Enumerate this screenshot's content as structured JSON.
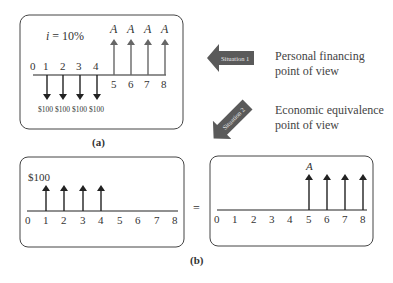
{
  "panel_a": {
    "interest_label": "i = 10%",
    "ticks": [
      "0",
      "1",
      "2",
      "3",
      "4",
      "5",
      "6",
      "7",
      "8"
    ],
    "outflows": [
      {
        "period": 1,
        "label": "$100"
      },
      {
        "period": 2,
        "label": "$100"
      },
      {
        "period": 3,
        "label": "$100"
      },
      {
        "period": 4,
        "label": "$100"
      }
    ],
    "inflows": [
      {
        "period": 5,
        "label": "A"
      },
      {
        "period": 6,
        "label": "A"
      },
      {
        "period": 7,
        "label": "A"
      },
      {
        "period": 8,
        "label": "A"
      }
    ],
    "caption": "(a)"
  },
  "arrows": {
    "situation1": {
      "label": "Situation 1",
      "text_line1": "Personal financing",
      "text_line2": "point of view"
    },
    "situation2": {
      "label": "Situation 2",
      "text_line1": "Economic equivalence",
      "text_line2": "point of view"
    }
  },
  "panel_b": {
    "left": {
      "amount_label": "$100",
      "ticks": [
        "0",
        "1",
        "2",
        "3",
        "4",
        "5",
        "6",
        "7",
        "8"
      ],
      "inflow_periods": [
        1,
        2,
        3,
        4
      ]
    },
    "equals": "=",
    "right": {
      "amount_label": "A",
      "ticks": [
        "0",
        "1",
        "2",
        "3",
        "4",
        "5",
        "6",
        "7",
        "8"
      ],
      "inflow_periods": [
        5,
        6,
        7,
        8
      ]
    },
    "caption": "(b)"
  },
  "colors": {
    "arrow_fill": "#5a5a5a",
    "line": "#222222",
    "box": "#444444"
  }
}
